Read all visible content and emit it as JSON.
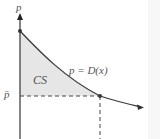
{
  "diagram": {
    "y_axis_label": "p",
    "price_level_label": "p̄",
    "region_label": "CS",
    "curve_label": "p = D(x)",
    "colors": {
      "axis": "#333333",
      "curve": "#3a3a3a",
      "shade": "#e6e6e6",
      "dashed": "#444444",
      "text": "#555555"
    }
  }
}
